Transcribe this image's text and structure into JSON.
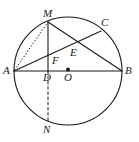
{
  "figure": {
    "type": "geometry-diagram",
    "width": 139,
    "height": 142,
    "background_color": "#ffffff",
    "stroke_color": "#1a1a1a"
  },
  "circle": {
    "name": "main-circle",
    "center_label": "O",
    "cx": 68,
    "cy": 71,
    "r": 54,
    "stroke": "#1a1a1a",
    "stroke_width": 1.1,
    "fill": "none"
  },
  "center_dot": {
    "name": "center-point-O",
    "cx": 68,
    "cy": 69.5,
    "r": 1.9,
    "fill": "#1a1a1a"
  },
  "points": [
    {
      "id": "A",
      "label": "A",
      "x": 14,
      "y": 71,
      "label_x": 3,
      "label_y": 65,
      "on_circle": true
    },
    {
      "id": "B",
      "label": "B",
      "x": 122,
      "y": 71,
      "label_x": 125,
      "label_y": 65,
      "on_circle": true
    },
    {
      "id": "M",
      "label": "M",
      "x": 48,
      "y": 22,
      "label_x": 43,
      "label_y": 8,
      "on_circle": true
    },
    {
      "id": "N",
      "label": "N",
      "x": 48,
      "y": 122,
      "label_x": 43,
      "label_y": 124,
      "on_circle": true
    },
    {
      "id": "C",
      "label": "C",
      "x": 101,
      "y": 31,
      "label_x": 101,
      "label_y": 17,
      "on_circle": true
    },
    {
      "id": "E",
      "label": "E",
      "x": 69,
      "y": 47,
      "label_x": 70,
      "label_y": 47,
      "on_circle": false
    },
    {
      "id": "F",
      "label": "F",
      "x": 48,
      "y": 58,
      "label_x": 52,
      "label_y": 55,
      "on_circle": false
    },
    {
      "id": "D",
      "label": "D",
      "x": 48,
      "y": 71,
      "label_x": 43,
      "label_y": 72,
      "on_circle": false
    },
    {
      "id": "O",
      "label": "O",
      "x": 68,
      "y": 71,
      "label_x": 64,
      "label_y": 72,
      "on_circle": false
    }
  ],
  "segments": [
    {
      "name": "segment-AB",
      "from": "A",
      "to": "B",
      "x1": 14,
      "y1": 71,
      "x2": 122,
      "y2": 71,
      "style": "solid",
      "stroke_width": 1.1
    },
    {
      "name": "segment-MD",
      "from": "M",
      "to": "D",
      "x1": 48,
      "y1": 22,
      "x2": 48,
      "y2": 71,
      "style": "solid",
      "stroke_width": 1.1
    },
    {
      "name": "segment-DN",
      "from": "D",
      "to": "N",
      "x1": 48,
      "y1": 71,
      "x2": 48,
      "y2": 122,
      "style": "dashed",
      "stroke_width": 1.0
    },
    {
      "name": "segment-MB",
      "from": "M",
      "to": "B",
      "x1": 48,
      "y1": 22,
      "x2": 122,
      "y2": 71,
      "style": "solid",
      "stroke_width": 1.1
    },
    {
      "name": "segment-AC",
      "from": "A",
      "to": "C",
      "x1": 14,
      "y1": 71,
      "x2": 101,
      "y2": 31,
      "style": "solid",
      "stroke_width": 1.1
    },
    {
      "name": "segment-MA",
      "from": "M",
      "to": "A",
      "x1": 48,
      "y1": 22,
      "x2": 14,
      "y2": 71,
      "style": "dotted",
      "stroke_width": 1.0
    }
  ],
  "labels": {
    "A": "A",
    "B": "B",
    "C": "C",
    "D": "D",
    "E": "E",
    "F": "F",
    "M": "M",
    "N": "N",
    "O": "O"
  }
}
